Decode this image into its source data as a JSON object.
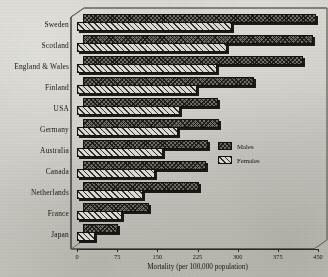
{
  "chart_data": {
    "type": "bar",
    "orientation": "horizontal",
    "title": "",
    "xlabel": "Mortality (per 100,000 population)",
    "ylabel": "",
    "xlim": [
      0,
      450
    ],
    "xticks": [
      0,
      75,
      150,
      225,
      300,
      375,
      450
    ],
    "xtick_labels": [
      "0",
      "75",
      "150",
      "225",
      "300",
      "375",
      "450"
    ],
    "grid": false,
    "legend_position": "right-middle",
    "style": "3d-pseudo",
    "categories": [
      "Sweden",
      "Scotland",
      "England & Wales",
      "Finland",
      "USA",
      "Germany",
      "Australia",
      "Canada",
      "Netherlands",
      "France",
      "Japan"
    ],
    "series": [
      {
        "name": "Males",
        "color": "#6e6b63",
        "pattern": "cross-hatch",
        "values": [
          435,
          429,
          410,
          319,
          252,
          254,
          233,
          230,
          217,
          124,
          65
        ]
      },
      {
        "name": "Females",
        "color": "#d9d8d1",
        "pattern": "diagonal-hatch",
        "values": [
          289,
          280,
          261,
          224,
          192,
          189,
          161,
          146,
          124,
          84,
          34
        ]
      }
    ]
  },
  "legend": {
    "items": [
      {
        "label": "Males"
      },
      {
        "label": "Females"
      }
    ]
  },
  "axis": {
    "x_title": "Mortality (per 100,000 population)"
  },
  "colors": {
    "background": "#cfcec8",
    "ink": "#17150f",
    "males": "#6e6b63",
    "females": "#d9d8d1"
  }
}
